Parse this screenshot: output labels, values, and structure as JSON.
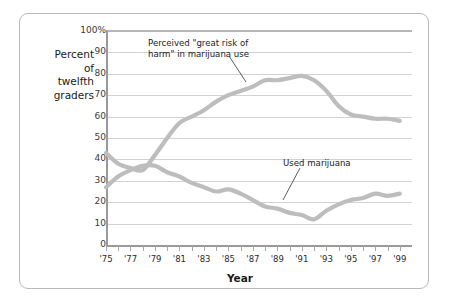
{
  "axes": {
    "ylabel_lines": [
      "Percent",
      "of",
      "twelfth",
      "graders"
    ],
    "xlabel": "Year",
    "yticks": [
      "0",
      "10",
      "20",
      "30",
      "40",
      "50",
      "60",
      "70",
      "80",
      "90",
      "100%"
    ],
    "xticks": [
      "'75",
      "'77",
      "'79",
      "'81",
      "'83",
      "'85",
      "'87",
      "'89",
      "'91",
      "'93",
      "'95",
      "'97",
      "'99"
    ]
  },
  "annotations": {
    "risk_line1": "Perceived \"great risk of",
    "risk_line2": "harm\" in marijuana use",
    "use": "Used marijuana"
  },
  "colors": {
    "line": "#bdbdbd",
    "grid": "#d2d2d2",
    "axis": "#9a9a9a",
    "border": "#b9b9b9",
    "text": "#1a1a1a"
  },
  "chart_data": {
    "type": "line",
    "title": "",
    "xlabel": "Year",
    "ylabel": "Percent of twelfth graders",
    "xlim": [
      1975,
      2000
    ],
    "ylim": [
      0,
      100
    ],
    "grid": true,
    "legend": "annotations-on-plot",
    "x": [
      1975,
      1976,
      1977,
      1978,
      1979,
      1980,
      1981,
      1982,
      1983,
      1984,
      1985,
      1986,
      1987,
      1988,
      1989,
      1990,
      1991,
      1992,
      1993,
      1994,
      1995,
      1996,
      1997,
      1998,
      1999
    ],
    "series": [
      {
        "name": "Perceived \"great risk of harm\" in marijuana use",
        "values": [
          43,
          38,
          36,
          35,
          42,
          50,
          57,
          60,
          63,
          67,
          70,
          72,
          74,
          77,
          77,
          78,
          79,
          77,
          72,
          65,
          61,
          60,
          59,
          59,
          58
        ]
      },
      {
        "name": "Used marijuana",
        "values": [
          27,
          32,
          35,
          37,
          37,
          34,
          32,
          29,
          27,
          25,
          26,
          24,
          21,
          18,
          17,
          15,
          14,
          12,
          16,
          19,
          21,
          22,
          24,
          23,
          24
        ]
      }
    ]
  }
}
